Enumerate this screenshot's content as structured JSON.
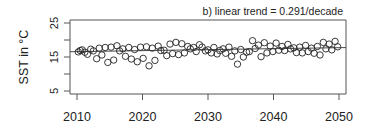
{
  "chart_data": {
    "type": "scatter",
    "title": "b) linear trend = 0.291/decade",
    "xlabel": "",
    "ylabel": "SST in °C",
    "xlim": [
      2009,
      2051
    ],
    "ylim": [
      5,
      25
    ],
    "xticks": [
      2010,
      2020,
      2030,
      2040,
      2050
    ],
    "yticks": [
      5,
      10,
      15,
      20,
      25
    ],
    "ytick_labels": [
      "5",
      "",
      "15",
      "",
      "25"
    ],
    "grid": false,
    "legend": null,
    "trend": {
      "slope_per_decade": 0.291,
      "x": [
        2009,
        2051
      ],
      "y": [
        16.55,
        17.77
      ]
    },
    "series": [
      {
        "name": "SST",
        "marker": "open-circle",
        "x": [
          2010.2,
          2010.5,
          2010.8,
          2011.2,
          2011.6,
          2012.1,
          2012.5,
          2013.0,
          2013.4,
          2013.8,
          2014.3,
          2014.7,
          2015.2,
          2015.6,
          2016.1,
          2016.5,
          2017.0,
          2017.4,
          2017.9,
          2018.3,
          2018.8,
          2019.2,
          2019.7,
          2020.1,
          2020.6,
          2021.0,
          2021.5,
          2021.9,
          2022.4,
          2022.8,
          2023.3,
          2023.7,
          2024.2,
          2024.6,
          2025.1,
          2025.5,
          2026.0,
          2026.4,
          2026.9,
          2027.3,
          2027.8,
          2028.2,
          2028.7,
          2029.1,
          2029.6,
          2030.0,
          2030.5,
          2030.9,
          2031.4,
          2031.8,
          2032.3,
          2032.7,
          2033.2,
          2033.6,
          2034.1,
          2034.5,
          2035.0,
          2035.4,
          2035.9,
          2036.3,
          2036.8,
          2037.2,
          2037.7,
          2038.1,
          2038.6,
          2039.0,
          2039.5,
          2039.9,
          2040.4,
          2040.8,
          2041.3,
          2041.7,
          2042.2,
          2042.6,
          2043.1,
          2043.5,
          2044.0,
          2044.4,
          2044.9,
          2045.3,
          2045.8,
          2046.2,
          2046.7,
          2047.1,
          2047.6,
          2048.0,
          2048.5,
          2048.9,
          2049.4,
          2049.8
        ],
        "y": [
          16.5,
          16.9,
          17.1,
          16.4,
          15.8,
          17.3,
          16.8,
          14.5,
          17.6,
          15.6,
          17.8,
          13.4,
          17.9,
          14.1,
          18.3,
          16.8,
          17.4,
          15.2,
          17.8,
          14.4,
          17.2,
          13.6,
          17.9,
          14.6,
          18.0,
          12.4,
          17.6,
          14.0,
          18.2,
          16.9,
          17.0,
          15.4,
          18.8,
          16.0,
          19.3,
          15.7,
          18.9,
          16.2,
          18.1,
          17.4,
          17.8,
          16.6,
          18.6,
          17.9,
          16.8,
          17.1,
          16.2,
          17.8,
          15.9,
          16.9,
          17.4,
          16.1,
          17.9,
          15.2,
          16.8,
          12.9,
          17.2,
          15.0,
          16.4,
          16.6,
          19.8,
          17.5,
          18.5,
          15.1,
          19.2,
          16.2,
          18.2,
          16.6,
          19.1,
          17.0,
          18.1,
          16.9,
          18.7,
          17.4,
          17.7,
          16.3,
          17.9,
          16.2,
          18.4,
          16.6,
          17.6,
          16.1,
          18.1,
          15.6,
          19.3,
          17.4,
          18.8,
          17.1,
          19.6,
          18.0
        ]
      }
    ]
  }
}
